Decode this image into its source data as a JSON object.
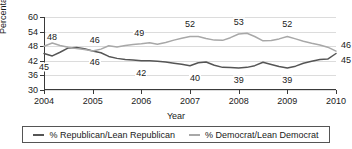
{
  "chart_data": {
    "type": "line",
    "title": "",
    "xlabel": "Year",
    "ylabel": "Percentage",
    "xlim": [
      2004,
      2010
    ],
    "ylim": [
      30,
      60
    ],
    "yticks": [
      30,
      36,
      42,
      48,
      54,
      60
    ],
    "xticks": [
      2004,
      2005,
      2006,
      2007,
      2008,
      2009,
      2010
    ],
    "grid": true,
    "legend_position": "bottom",
    "series": [
      {
        "name": "% Republican/Lean Republican",
        "color": "#555555",
        "x": [
          2004.0,
          2004.17,
          2004.33,
          2004.5,
          2004.67,
          2004.83,
          2005.0,
          2005.17,
          2005.33,
          2005.5,
          2005.67,
          2005.83,
          2006.0,
          2006.17,
          2006.33,
          2006.5,
          2006.67,
          2006.83,
          2007.0,
          2007.17,
          2007.33,
          2007.5,
          2007.67,
          2007.83,
          2008.0,
          2008.17,
          2008.33,
          2008.5,
          2008.67,
          2008.83,
          2009.0,
          2009.17,
          2009.33,
          2009.5,
          2009.67,
          2009.83,
          2010.0
        ],
        "y": [
          45.0,
          44.0,
          45.5,
          47.3,
          47.5,
          47.0,
          46.0,
          45.3,
          43.8,
          43.0,
          42.5,
          42.3,
          42.0,
          42.0,
          41.8,
          41.5,
          41.0,
          40.6,
          40.0,
          41.2,
          41.5,
          40.2,
          39.3,
          39.2,
          39.0,
          39.3,
          40.0,
          41.4,
          40.5,
          39.7,
          39.0,
          39.8,
          41.0,
          41.8,
          42.5,
          42.7,
          45.0
        ],
        "labeled_points": [
          {
            "x": 2004.0,
            "value": 45,
            "dx": 0,
            "dy": 13
          },
          {
            "x": 2005.0,
            "value": 46,
            "dx": 2,
            "dy": 11
          },
          {
            "x": 2006.0,
            "value": 42,
            "dx": 0,
            "dy": 12
          },
          {
            "x": 2007.0,
            "value": 40,
            "dx": 5,
            "dy": 12
          },
          {
            "x": 2008.0,
            "value": 39,
            "dx": 0,
            "dy": 12
          },
          {
            "x": 2009.0,
            "value": 39,
            "dx": 0,
            "dy": 12
          },
          {
            "x": 2010.0,
            "value": 45,
            "dx": 10,
            "dy": 6
          }
        ]
      },
      {
        "name": "% Democrat/Lean Democrat",
        "color": "#a8a8a8",
        "x": [
          2004.0,
          2004.17,
          2004.33,
          2004.5,
          2004.67,
          2004.83,
          2005.0,
          2005.17,
          2005.33,
          2005.5,
          2005.67,
          2005.83,
          2006.0,
          2006.17,
          2006.33,
          2006.5,
          2006.67,
          2006.83,
          2007.0,
          2007.17,
          2007.33,
          2007.5,
          2007.67,
          2007.83,
          2008.0,
          2008.17,
          2008.33,
          2008.5,
          2008.67,
          2008.83,
          2009.0,
          2009.17,
          2009.33,
          2009.5,
          2009.67,
          2009.83,
          2010.0
        ],
        "y": [
          48.0,
          49.3,
          48.3,
          47.6,
          47.0,
          46.6,
          46.0,
          46.8,
          48.2,
          47.7,
          48.3,
          48.7,
          49.0,
          49.4,
          48.8,
          49.5,
          50.5,
          51.3,
          52.0,
          52.0,
          51.2,
          50.5,
          50.4,
          51.5,
          53.0,
          53.3,
          52.0,
          50.2,
          50.3,
          51.0,
          52.0,
          51.0,
          50.0,
          49.2,
          48.5,
          47.6,
          46.0
        ],
        "labeled_points": [
          {
            "x": 2005.0,
            "value": 46,
            "dx": 2,
            "dy": -11
          },
          {
            "x": 2006.0,
            "value": 49,
            "dx": -2,
            "dy": -11
          },
          {
            "x": 2007.0,
            "value": 52,
            "dx": 0,
            "dy": -12
          },
          {
            "x": 2008.0,
            "value": 53,
            "dx": 0,
            "dy": -12
          },
          {
            "x": 2009.0,
            "value": 52,
            "dx": 0,
            "dy": -12
          },
          {
            "x": 2010.0,
            "value": 46,
            "dx": 10,
            "dy": -6
          },
          {
            "x": 2004.0,
            "value": 48,
            "dx": 8,
            "dy": -9
          }
        ]
      }
    ]
  },
  "legend": {
    "entries": [
      {
        "label": "% Republican/Lean Republican"
      },
      {
        "label": "% Democrat/Lean Democrat"
      }
    ]
  }
}
